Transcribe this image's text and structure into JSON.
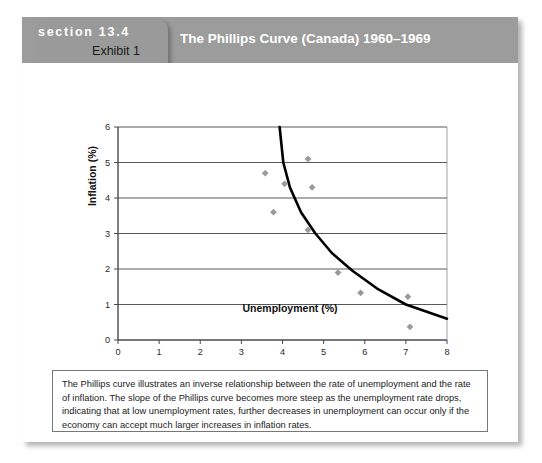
{
  "header": {
    "section_label": "section 13.4",
    "exhibit_label": "Exhibit 1",
    "title": "The Phillips Curve (Canada) 1960–1969",
    "bar_color": "#9c9c9c",
    "tab_color": "#9a9a9a",
    "section_text_color": "#ffffff",
    "exhibit_text_color": "#1a1a1a"
  },
  "caption": {
    "text": "The Phillips curve illustrates an inverse relationship between the rate of unemployment and the rate of inflation. The slope of the Phillips curve becomes more steep as the unemployment rate drops, indicating that at low unemployment rates, further decreases in unemployment can occur only if the economy can accept much larger increases in inflation rates."
  },
  "chart_data": {
    "type": "scatter",
    "title": "The Phillips Curve (Canada) 1960–1969",
    "xlabel": "Unemployment (%)",
    "ylabel": "Inflation (%)",
    "xlim": [
      0,
      8
    ],
    "ylim": [
      0,
      6
    ],
    "xticks": [
      0,
      1,
      2,
      3,
      4,
      5,
      6,
      7,
      8
    ],
    "xtick_labels": [
      "0",
      "1",
      "2",
      "3",
      "4",
      "5",
      "6",
      "7",
      "8"
    ],
    "yticks": [
      0,
      1,
      2,
      3,
      4,
      5,
      6
    ],
    "ytick_labels": [
      "0",
      "1",
      "2",
      "3",
      "4",
      "5",
      "6"
    ],
    "grid": "horizontal",
    "grid_color": "#595959",
    "legend": "none",
    "marker_color": "#9a9a9a",
    "marker_shape": "diamond",
    "curve_color": "#000000",
    "points": [
      {
        "x": 3.58,
        "y": 4.7
      },
      {
        "x": 4.05,
        "y": 4.4
      },
      {
        "x": 3.78,
        "y": 3.6
      },
      {
        "x": 4.62,
        "y": 5.1
      },
      {
        "x": 4.72,
        "y": 4.3
      },
      {
        "x": 4.62,
        "y": 3.1
      },
      {
        "x": 5.35,
        "y": 1.9
      },
      {
        "x": 5.9,
        "y": 1.33
      },
      {
        "x": 7.05,
        "y": 1.22
      },
      {
        "x": 7.1,
        "y": 0.37
      }
    ],
    "series": [
      {
        "name": "Phillips curve",
        "type": "curve",
        "description": "Fitted hyperbolic Phillips curve, steep at low unemployment flattening toward high unemployment",
        "points": [
          {
            "x": 3.93,
            "y": 6.0
          },
          {
            "x": 4.02,
            "y": 5.0
          },
          {
            "x": 4.18,
            "y": 4.3
          },
          {
            "x": 4.45,
            "y": 3.6
          },
          {
            "x": 4.8,
            "y": 3.0
          },
          {
            "x": 5.2,
            "y": 2.45
          },
          {
            "x": 5.7,
            "y": 1.95
          },
          {
            "x": 6.3,
            "y": 1.45
          },
          {
            "x": 7.0,
            "y": 1.0
          },
          {
            "x": 8.0,
            "y": 0.6
          }
        ]
      }
    ]
  }
}
